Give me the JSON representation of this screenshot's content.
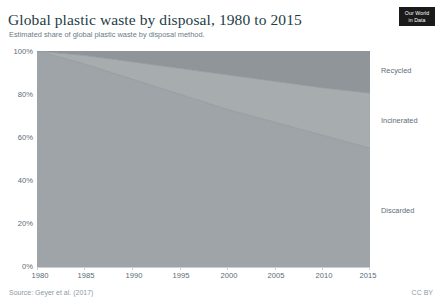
{
  "header": {
    "title": "Global plastic waste by disposal, 1980 to 2015",
    "subtitle": "Estimated share of global plastic waste by disposal method.",
    "logo_line1": "Our World",
    "logo_line2": "in Data"
  },
  "footer": {
    "source": "Source: Geyer et al. (2017)",
    "license": "CC BY"
  },
  "series_labels": {
    "recycled": "Recycled",
    "incinerated": "Incinerated",
    "discarded": "Discarded"
  },
  "colors": {
    "discarded": "#9ea4a7",
    "incinerated": "#a7acae",
    "recycled": "#8f9599",
    "axis": "#c9cfd3",
    "tick_text": "#5b6b75",
    "title": "#1d3d47",
    "subtitle": "#6a7b85",
    "footer": "#8d9aa2",
    "logo_bg": "#1a1a1a",
    "plot_bg": "#ffffff"
  },
  "chart_data": {
    "type": "area",
    "title": "Global plastic waste by disposal, 1980 to 2015",
    "subtitle": "Estimated share of global plastic waste by disposal method.",
    "xlabel": "",
    "ylabel": "",
    "stacked": true,
    "stack_order_bottom_to_top": [
      "Discarded",
      "Incinerated",
      "Recycled"
    ],
    "grid": false,
    "legend": "direct-labels-right",
    "xlim": [
      1980,
      2015
    ],
    "ylim": [
      0,
      100
    ],
    "y_ticks": [
      0,
      20,
      40,
      60,
      80,
      100
    ],
    "y_tick_labels": [
      "0%",
      "20%",
      "40%",
      "60%",
      "80%",
      "100%"
    ],
    "x_ticks": [
      1980,
      1985,
      1990,
      1995,
      2000,
      2005,
      2010,
      2015
    ],
    "x_tick_labels": [
      "1980",
      "1985",
      "1990",
      "1995",
      "2000",
      "2005",
      "2010",
      "2015"
    ],
    "x": [
      1980,
      1985,
      1990,
      1995,
      2000,
      2005,
      2010,
      2015
    ],
    "series": [
      {
        "name": "Discarded",
        "values": [
          100.0,
          94.0,
          87.0,
          80.0,
          73.0,
          67.0,
          61.0,
          55.0
        ]
      },
      {
        "name": "Incinerated",
        "values": [
          0.0,
          4.0,
          8.0,
          12.0,
          16.0,
          19.0,
          22.0,
          25.5
        ]
      },
      {
        "name": "Recycled",
        "values": [
          0.0,
          2.0,
          5.0,
          8.0,
          11.0,
          14.0,
          17.0,
          19.5
        ]
      }
    ],
    "units": "percent of global plastic waste"
  }
}
